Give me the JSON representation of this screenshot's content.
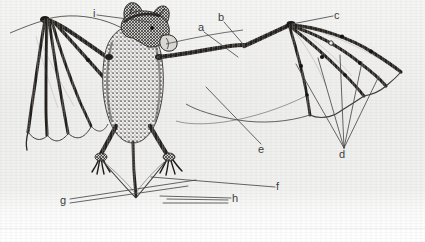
{
  "figure": {
    "kind": "scanned-zoological-illustration",
    "view": "dorsal, wings partly spread",
    "technique": "halftone stipple line engraving",
    "background_color": "#f2f2f1",
    "ink_color": "#3a3a3a",
    "leader_line_color": "#4a4a4a"
  },
  "labels": [
    {
      "id": "a",
      "text": "a",
      "x": 198,
      "y": 22,
      "leader": [
        [
          204,
          32
        ],
        [
          238,
          57
        ]
      ]
    },
    {
      "id": "b",
      "text": "b",
      "x": 218,
      "y": 12,
      "leader": [
        [
          224,
          22
        ],
        [
          243,
          44
        ]
      ]
    },
    {
      "id": "c",
      "text": "c",
      "x": 334,
      "y": 10,
      "leader": [
        [
          333,
          16
        ],
        [
          292,
          24
        ]
      ]
    },
    {
      "id": "d",
      "text": "d",
      "x": 339,
      "y": 149,
      "leader": [
        [
          344,
          148
        ],
        [
          344,
          148
        ]
      ]
    },
    {
      "id": "e",
      "text": "e",
      "x": 258,
      "y": 144,
      "leader": [
        [
          261,
          144
        ],
        [
          206,
          87
        ]
      ]
    },
    {
      "id": "f",
      "text": "f",
      "x": 276,
      "y": 181,
      "leader": [
        [
          275,
          187
        ],
        [
          151,
          177
        ]
      ]
    },
    {
      "id": "g",
      "text": "g",
      "x": 60,
      "y": 195,
      "leader": [
        [
          70,
          199
        ],
        [
          196,
          180
        ]
      ]
    },
    {
      "id": "h",
      "text": "h",
      "x": 232,
      "y": 193,
      "leader": [
        [
          231,
          198
        ],
        [
          160,
          196
        ]
      ]
    },
    {
      "id": "i",
      "text": "i",
      "x": 93,
      "y": 8,
      "leader": [
        [
          97,
          15
        ],
        [
          150,
          22
        ]
      ]
    }
  ],
  "d_leader_fan": [
    [
      [
        344,
        148
      ],
      [
        296,
        64
      ]
    ],
    [
      [
        344,
        148
      ],
      [
        318,
        58
      ]
    ],
    [
      [
        344,
        148
      ],
      [
        340,
        55
      ]
    ],
    [
      [
        344,
        148
      ],
      [
        362,
        62
      ]
    ],
    [
      [
        344,
        148
      ],
      [
        379,
        76
      ]
    ]
  ],
  "h_leader_extra": [
    [
      [
        228,
        200
      ],
      [
        167,
        199
      ]
    ],
    [
      [
        228,
        203
      ],
      [
        163,
        203
      ]
    ]
  ],
  "g_leader_extra": [
    [
      [
        70,
        203
      ],
      [
        188,
        186
      ]
    ]
  ],
  "anatomy": {
    "body": {
      "cx": 133,
      "cy": 80,
      "rx": 26,
      "ry": 52
    },
    "head": {
      "cx": 148,
      "cy": 30
    },
    "left_wing_label": "folded left wing with digit bones",
    "right_wing_label": "extended right wing membrane",
    "tail_label": "uropatagium and tail",
    "feet_label": "clawed hind feet"
  }
}
